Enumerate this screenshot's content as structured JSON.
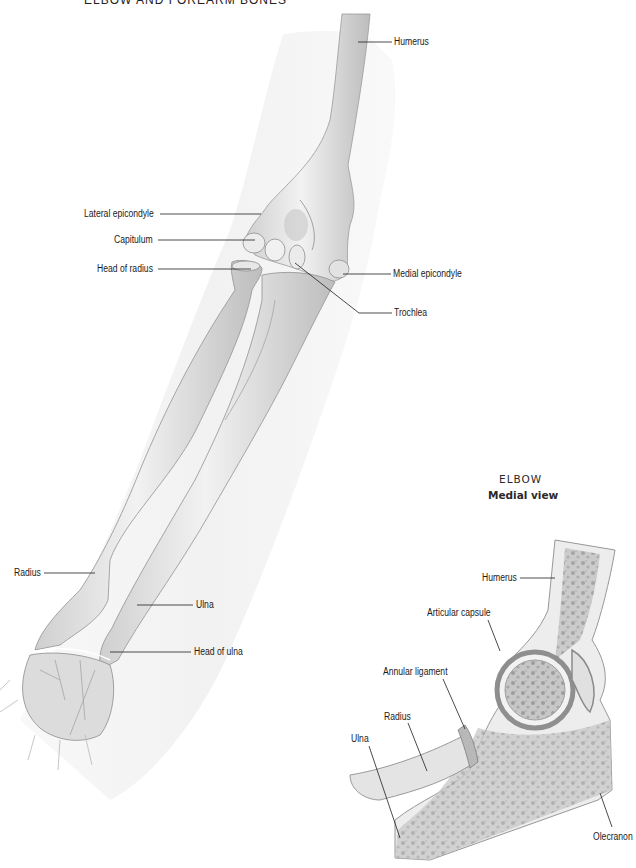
{
  "figure": {
    "title": "ELBOW AND FOREARM BONES",
    "main_view": {
      "labels": [
        {
          "id": "humerus",
          "text": "Humerus"
        },
        {
          "id": "lateral_epicondyle",
          "text": "Lateral epicondyle"
        },
        {
          "id": "capitulum",
          "text": "Capitulum"
        },
        {
          "id": "head_of_radius",
          "text": "Head of radius"
        },
        {
          "id": "medial_epicondyle",
          "text": "Medial epicondyle"
        },
        {
          "id": "trochlea",
          "text": "Trochlea"
        },
        {
          "id": "radius",
          "text": "Radius"
        },
        {
          "id": "ulna",
          "text": "Ulna"
        },
        {
          "id": "head_of_ulna",
          "text": "Head of ulna"
        }
      ]
    },
    "inset": {
      "title": "ELBOW",
      "subtitle": "Medial view",
      "labels": [
        {
          "id": "humerus",
          "text": "Humerus"
        },
        {
          "id": "articular_capsule",
          "text": "Articular capsule"
        },
        {
          "id": "annular_ligament",
          "text": "Annular ligament"
        },
        {
          "id": "radius",
          "text": "Radius"
        },
        {
          "id": "ulna",
          "text": "Ulna"
        },
        {
          "id": "olecranon",
          "text": "Olecranon"
        }
      ]
    },
    "colors": {
      "bone_fill": "#e6e6e6",
      "bone_shade": "#b9b9b9",
      "outline": "#8a8a8a",
      "skin_shadow": "#f1f1f1",
      "marrow": "#9a9a9a",
      "leader_line": "#1e1e1e"
    }
  }
}
